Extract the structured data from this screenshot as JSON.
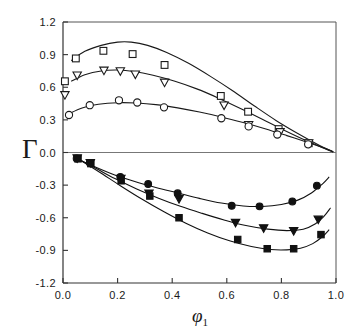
{
  "chart_data": {
    "type": "scatter",
    "title": "",
    "xlabel": "φ₁",
    "ylabel": "Γ",
    "xlim": [
      0.0,
      1.0
    ],
    "ylim": [
      -1.2,
      1.2
    ],
    "xticks": [
      "0.0",
      "0.2",
      "0.4",
      "0.6",
      "0.8",
      "1.0"
    ],
    "xtick_values": [
      0.0,
      0.2,
      0.4,
      0.6,
      0.8,
      1.0
    ],
    "yticks": [
      "1.2",
      "0.9",
      "0.6",
      "0.3",
      "0.0",
      "-0.3",
      "-0.6",
      "-0.9",
      "-1.2"
    ],
    "ytick_values": [
      1.2,
      0.9,
      0.6,
      0.3,
      0.0,
      -0.3,
      -0.6,
      -0.9,
      -1.2
    ],
    "grid": false,
    "legend": "none",
    "zero_line": true,
    "series": [
      {
        "name": "open-square-upper",
        "marker": "open-square",
        "color": "#1a1a1a",
        "points": [
          {
            "x": 0.007,
            "y": 0.655
          },
          {
            "x": 0.047,
            "y": 0.865
          },
          {
            "x": 0.148,
            "y": 0.935
          },
          {
            "x": 0.255,
            "y": 0.905
          },
          {
            "x": 0.372,
            "y": 0.805
          },
          {
            "x": 0.578,
            "y": 0.52
          },
          {
            "x": 0.678,
            "y": 0.375
          },
          {
            "x": 0.79,
            "y": 0.215
          },
          {
            "x": 0.9,
            "y": 0.085
          }
        ],
        "curve": [
          {
            "x": 0.03,
            "y": 0.845
          },
          {
            "x": 0.08,
            "y": 0.93
          },
          {
            "x": 0.14,
            "y": 0.985
          },
          {
            "x": 0.2,
            "y": 1.015
          },
          {
            "x": 0.25,
            "y": 1.015
          },
          {
            "x": 0.31,
            "y": 0.985
          },
          {
            "x": 0.38,
            "y": 0.92
          },
          {
            "x": 0.46,
            "y": 0.82
          },
          {
            "x": 0.54,
            "y": 0.7
          },
          {
            "x": 0.62,
            "y": 0.57
          },
          {
            "x": 0.7,
            "y": 0.43
          },
          {
            "x": 0.78,
            "y": 0.295
          },
          {
            "x": 0.86,
            "y": 0.175
          },
          {
            "x": 0.94,
            "y": 0.065
          },
          {
            "x": 0.99,
            "y": 0.005
          }
        ]
      },
      {
        "name": "open-triangle-upper",
        "marker": "open-triangle-down",
        "color": "#1a1a1a",
        "points": [
          {
            "x": 0.007,
            "y": 0.525
          },
          {
            "x": 0.052,
            "y": 0.705
          },
          {
            "x": 0.15,
            "y": 0.75
          },
          {
            "x": 0.21,
            "y": 0.745
          },
          {
            "x": 0.265,
            "y": 0.715
          },
          {
            "x": 0.372,
            "y": 0.64
          },
          {
            "x": 0.59,
            "y": 0.43
          },
          {
            "x": 0.68,
            "y": 0.25
          },
          {
            "x": 0.795,
            "y": 0.185
          },
          {
            "x": 0.9,
            "y": 0.082
          }
        ],
        "curve": [
          {
            "x": 0.03,
            "y": 0.655
          },
          {
            "x": 0.08,
            "y": 0.715
          },
          {
            "x": 0.14,
            "y": 0.75
          },
          {
            "x": 0.2,
            "y": 0.758
          },
          {
            "x": 0.26,
            "y": 0.745
          },
          {
            "x": 0.33,
            "y": 0.71
          },
          {
            "x": 0.41,
            "y": 0.655
          },
          {
            "x": 0.49,
            "y": 0.585
          },
          {
            "x": 0.57,
            "y": 0.5
          },
          {
            "x": 0.65,
            "y": 0.405
          },
          {
            "x": 0.73,
            "y": 0.305
          },
          {
            "x": 0.81,
            "y": 0.205
          },
          {
            "x": 0.89,
            "y": 0.11
          },
          {
            "x": 0.96,
            "y": 0.035
          },
          {
            "x": 0.99,
            "y": 0.005
          }
        ]
      },
      {
        "name": "open-circle-upper",
        "marker": "open-circle",
        "color": "#1a1a1a",
        "points": [
          {
            "x": 0.022,
            "y": 0.345
          },
          {
            "x": 0.098,
            "y": 0.435
          },
          {
            "x": 0.205,
            "y": 0.48
          },
          {
            "x": 0.272,
            "y": 0.46
          },
          {
            "x": 0.37,
            "y": 0.415
          },
          {
            "x": 0.58,
            "y": 0.315
          },
          {
            "x": 0.68,
            "y": 0.24
          },
          {
            "x": 0.785,
            "y": 0.165
          },
          {
            "x": 0.898,
            "y": 0.075
          }
        ],
        "curve": [
          {
            "x": 0.02,
            "y": 0.355
          },
          {
            "x": 0.07,
            "y": 0.41
          },
          {
            "x": 0.13,
            "y": 0.443
          },
          {
            "x": 0.2,
            "y": 0.458
          },
          {
            "x": 0.27,
            "y": 0.455
          },
          {
            "x": 0.34,
            "y": 0.44
          },
          {
            "x": 0.42,
            "y": 0.41
          },
          {
            "x": 0.5,
            "y": 0.372
          },
          {
            "x": 0.58,
            "y": 0.327
          },
          {
            "x": 0.66,
            "y": 0.275
          },
          {
            "x": 0.74,
            "y": 0.218
          },
          {
            "x": 0.82,
            "y": 0.155
          },
          {
            "x": 0.9,
            "y": 0.09
          },
          {
            "x": 0.96,
            "y": 0.038
          },
          {
            "x": 0.99,
            "y": 0.008
          }
        ]
      },
      {
        "name": "filled-circle-lower",
        "marker": "filled-circle",
        "color": "#111111",
        "points": [
          {
            "x": 0.05,
            "y": -0.055
          },
          {
            "x": 0.098,
            "y": -0.095
          },
          {
            "x": 0.21,
            "y": -0.225
          },
          {
            "x": 0.312,
            "y": -0.29
          },
          {
            "x": 0.42,
            "y": -0.375
          },
          {
            "x": 0.618,
            "y": -0.49
          },
          {
            "x": 0.72,
            "y": -0.495
          },
          {
            "x": 0.84,
            "y": -0.45
          },
          {
            "x": 0.93,
            "y": -0.305
          }
        ],
        "curve": [
          {
            "x": 0.05,
            "y": -0.055
          },
          {
            "x": 0.11,
            "y": -0.125
          },
          {
            "x": 0.18,
            "y": -0.198
          },
          {
            "x": 0.26,
            "y": -0.265
          },
          {
            "x": 0.34,
            "y": -0.322
          },
          {
            "x": 0.42,
            "y": -0.372
          },
          {
            "x": 0.5,
            "y": -0.422
          },
          {
            "x": 0.58,
            "y": -0.465
          },
          {
            "x": 0.66,
            "y": -0.492
          },
          {
            "x": 0.73,
            "y": -0.496
          },
          {
            "x": 0.8,
            "y": -0.478
          },
          {
            "x": 0.86,
            "y": -0.438
          },
          {
            "x": 0.91,
            "y": -0.372
          },
          {
            "x": 0.95,
            "y": -0.29
          },
          {
            "x": 0.975,
            "y": -0.225
          }
        ]
      },
      {
        "name": "filled-triangle-lower",
        "marker": "filled-triangle-down",
        "color": "#111111",
        "points": [
          {
            "x": 0.052,
            "y": -0.055
          },
          {
            "x": 0.1,
            "y": -0.1
          },
          {
            "x": 0.212,
            "y": -0.245
          },
          {
            "x": 0.315,
            "y": -0.38
          },
          {
            "x": 0.425,
            "y": -0.43
          },
          {
            "x": 0.632,
            "y": -0.65
          },
          {
            "x": 0.735,
            "y": -0.7
          },
          {
            "x": 0.845,
            "y": -0.725
          },
          {
            "x": 0.935,
            "y": -0.62
          }
        ],
        "curve": [
          {
            "x": 0.052,
            "y": -0.055
          },
          {
            "x": 0.12,
            "y": -0.145
          },
          {
            "x": 0.19,
            "y": -0.24
          },
          {
            "x": 0.27,
            "y": -0.335
          },
          {
            "x": 0.35,
            "y": -0.42
          },
          {
            "x": 0.43,
            "y": -0.495
          },
          {
            "x": 0.51,
            "y": -0.56
          },
          {
            "x": 0.59,
            "y": -0.62
          },
          {
            "x": 0.67,
            "y": -0.672
          },
          {
            "x": 0.75,
            "y": -0.705
          },
          {
            "x": 0.82,
            "y": -0.718
          },
          {
            "x": 0.88,
            "y": -0.705
          },
          {
            "x": 0.925,
            "y": -0.655
          },
          {
            "x": 0.955,
            "y": -0.59
          },
          {
            "x": 0.98,
            "y": -0.51
          }
        ]
      },
      {
        "name": "filled-square-lower",
        "marker": "filled-square",
        "color": "#111111",
        "points": [
          {
            "x": 0.055,
            "y": -0.058
          },
          {
            "x": 0.102,
            "y": -0.102
          },
          {
            "x": 0.213,
            "y": -0.26
          },
          {
            "x": 0.318,
            "y": -0.4
          },
          {
            "x": 0.425,
            "y": -0.6
          },
          {
            "x": 0.64,
            "y": -0.8
          },
          {
            "x": 0.748,
            "y": -0.885
          },
          {
            "x": 0.845,
            "y": -0.885
          },
          {
            "x": 0.945,
            "y": -0.755
          }
        ],
        "curve": [
          {
            "x": 0.055,
            "y": -0.058
          },
          {
            "x": 0.13,
            "y": -0.175
          },
          {
            "x": 0.21,
            "y": -0.305
          },
          {
            "x": 0.29,
            "y": -0.43
          },
          {
            "x": 0.37,
            "y": -0.545
          },
          {
            "x": 0.45,
            "y": -0.65
          },
          {
            "x": 0.53,
            "y": -0.74
          },
          {
            "x": 0.61,
            "y": -0.812
          },
          {
            "x": 0.69,
            "y": -0.865
          },
          {
            "x": 0.76,
            "y": -0.892
          },
          {
            "x": 0.82,
            "y": -0.895
          },
          {
            "x": 0.87,
            "y": -0.88
          },
          {
            "x": 0.915,
            "y": -0.838
          },
          {
            "x": 0.95,
            "y": -0.775
          },
          {
            "x": 0.975,
            "y": -0.71
          }
        ]
      }
    ]
  }
}
